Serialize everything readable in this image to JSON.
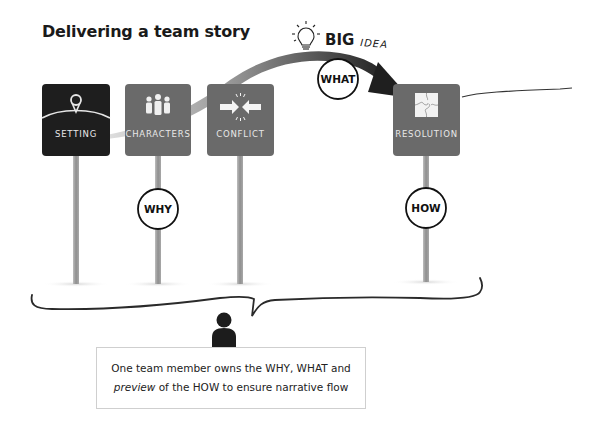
{
  "title": "Delivering a team story",
  "big_idea": {
    "big": "BIG",
    "idea": "IDEA",
    "icon": "lightbulb-icon"
  },
  "signs": [
    {
      "label": "SETTING",
      "icon": "location-pin-icon",
      "color": "#1e1e1e"
    },
    {
      "label": "CHARACTERS",
      "icon": "people-icon",
      "color": "#6a6a6a"
    },
    {
      "label": "CONFLICT",
      "icon": "converging-arrows-icon",
      "color": "#6a6a6a"
    },
    {
      "label": "RESOLUTION",
      "icon": "puzzle-icon",
      "color": "#6a6a6a"
    }
  ],
  "circles": {
    "why": "WHY",
    "what": "WHAT",
    "how": "HOW"
  },
  "callout": {
    "line1": "One team member owns the WHY, WHAT and",
    "line2_em": "preview",
    "line2_rest": " of the HOW to ensure narrative flow"
  },
  "colors": {
    "dark_sign": "#1e1e1e",
    "grey_sign": "#6a6a6a",
    "post": "#9a9a9a",
    "arrow_dark": "#2a2a2a",
    "arrow_light": "#b5b5b5"
  }
}
